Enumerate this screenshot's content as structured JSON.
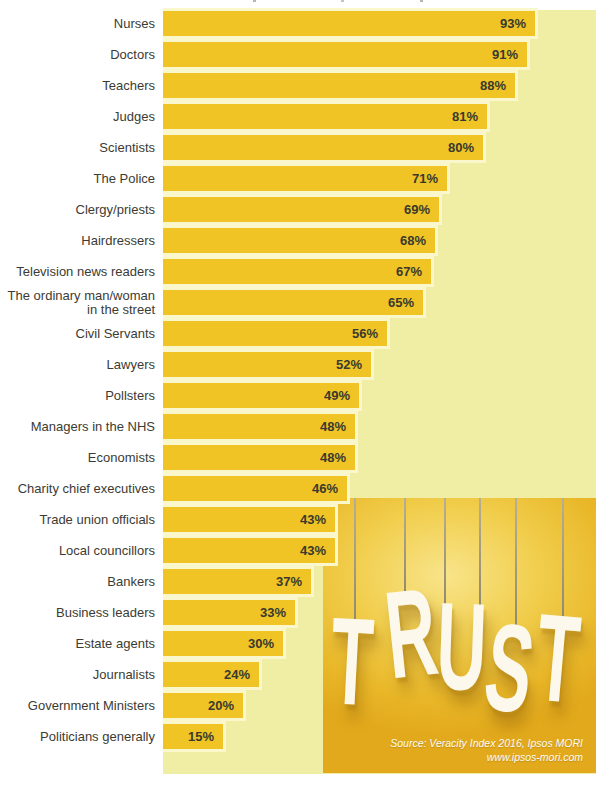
{
  "chart_data": {
    "type": "bar",
    "orientation": "horizontal",
    "unit": "%",
    "xlim": [
      0,
      100
    ],
    "grid": false,
    "legend": false,
    "value_labels": "inside-right",
    "categories": [
      "Nurses",
      "Doctors",
      "Teachers",
      "Judges",
      "Scientists",
      "The Police",
      "Clergy/priests",
      "Hairdressers",
      "Television news readers",
      "The ordinary man/woman in the street",
      "Civil Servants",
      "Lawyers",
      "Pollsters",
      "Managers in the NHS",
      "Economists",
      "Charity chief executives",
      "Trade union officials",
      "Local councillors",
      "Bankers",
      "Business leaders",
      "Estate agents",
      "Journalists",
      "Government Ministers",
      "Politicians generally"
    ],
    "values": [
      93,
      91,
      88,
      81,
      80,
      71,
      69,
      68,
      67,
      65,
      56,
      52,
      49,
      48,
      48,
      46,
      43,
      43,
      37,
      33,
      30,
      24,
      20,
      15
    ],
    "colors": {
      "bar": "#F0C424",
      "bar_outline": "#FAF7CD",
      "plot_background": "#F0EEA4",
      "text": "#3C3B33"
    }
  },
  "trust_graphic": {
    "word": "TRUST",
    "letters": [
      "T",
      "R",
      "U",
      "S",
      "T"
    ],
    "source_line1": "Source: Veracity Index 2016, Ipsos MORI",
    "source_line2": "www.ipsos-mori.com",
    "colors": {
      "background_top": "#F8E48A",
      "background_bottom": "#E2A91C",
      "letters": "#FCF9EC",
      "string": "#8F8870"
    }
  }
}
